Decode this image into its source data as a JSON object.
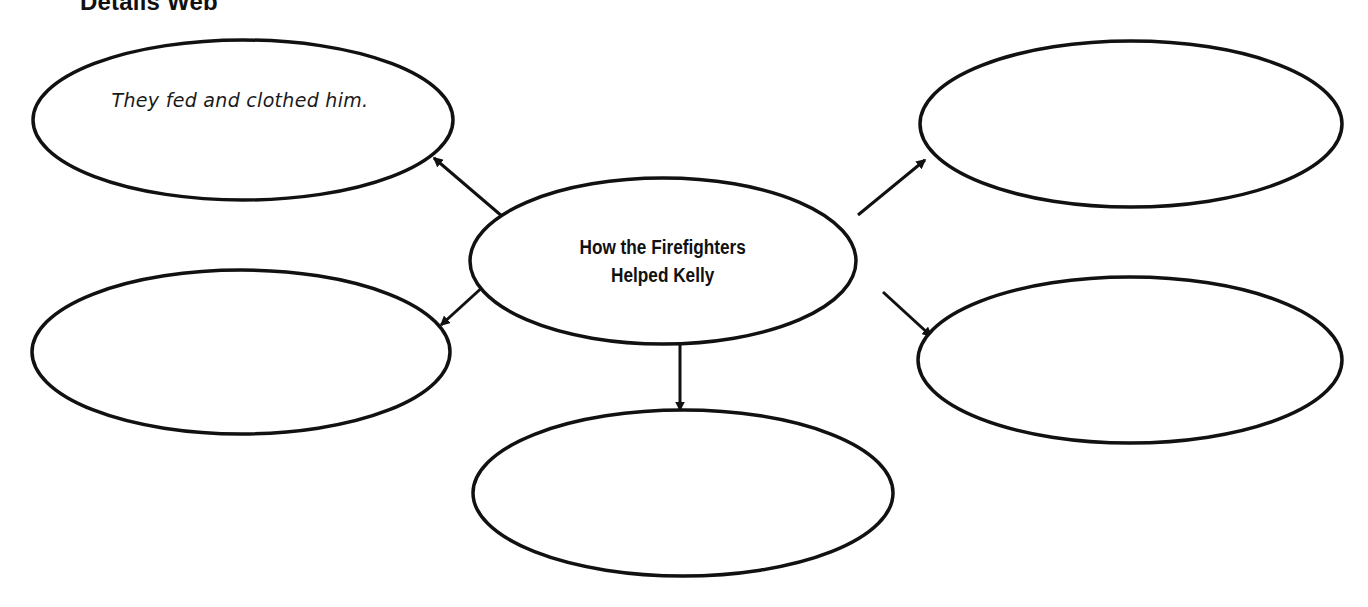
{
  "title": "Details Web",
  "center": {
    "label": "How the Firefighters\nHelped Kelly"
  },
  "details": [
    {
      "position": "top-left",
      "text": "They fed and clothed him."
    },
    {
      "position": "middle-left",
      "text": ""
    },
    {
      "position": "bottom-center",
      "text": ""
    },
    {
      "position": "top-right",
      "text": ""
    },
    {
      "position": "middle-right",
      "text": ""
    }
  ],
  "colors": {
    "stroke": "#111111",
    "background": "#ffffff"
  }
}
